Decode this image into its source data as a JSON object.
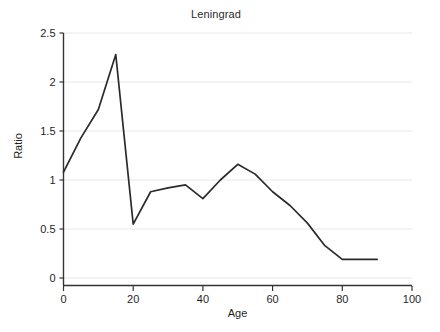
{
  "chart_data": {
    "type": "line",
    "title": "Leningrad",
    "xlabel": "Age",
    "ylabel": "Ratio",
    "xlim": [
      0,
      100
    ],
    "ylim": [
      0,
      2.5
    ],
    "grid": true,
    "legend": "none",
    "xticks": [
      0,
      20,
      40,
      60,
      80,
      100
    ],
    "xtick_labels": [
      "0",
      "20",
      "40",
      "60",
      "80",
      "100"
    ],
    "yticks": [
      0,
      0.5,
      1,
      1.5,
      2,
      2.5
    ],
    "ytick_labels": [
      "0",
      "0.5",
      "1",
      "1.5",
      "2",
      "2.5"
    ],
    "series": [
      {
        "name": "Ratio",
        "color": "#2b2b2b",
        "x": [
          0,
          5,
          10,
          15,
          20,
          25,
          30,
          35,
          40,
          45,
          50,
          55,
          60,
          65,
          70,
          75,
          80,
          85,
          90
        ],
        "values": [
          1.08,
          1.43,
          1.72,
          2.28,
          0.55,
          0.88,
          0.92,
          0.95,
          0.81,
          1.0,
          1.16,
          1.06,
          0.88,
          0.74,
          0.56,
          0.33,
          0.19,
          0.19,
          0.19
        ]
      }
    ]
  },
  "figure": {
    "background_color": "#ffffff",
    "line_color": "#2b2b2b",
    "grid_color": "#e8e8e8",
    "axis_color": "#333333"
  }
}
